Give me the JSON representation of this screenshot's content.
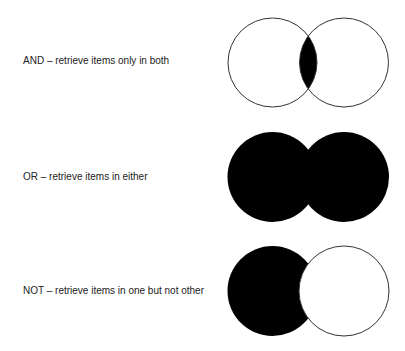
{
  "rows": [
    {
      "operator": "AND",
      "label": "AND – retrieve items only in both",
      "fill": "intersection"
    },
    {
      "operator": "OR",
      "label": "OR – retrieve items in either",
      "fill": "union"
    },
    {
      "operator": "NOT",
      "label": "NOT – retrieve items in one but not other",
      "fill": "left-only"
    }
  ],
  "colors": {
    "fill": "#000000",
    "stroke": "#333333",
    "background": "#ffffff"
  }
}
